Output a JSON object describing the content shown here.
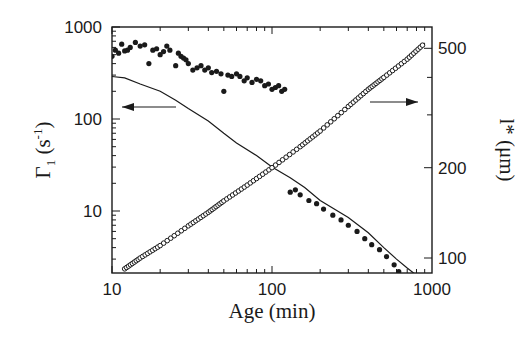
{
  "chart_data": {
    "type": "scatter",
    "title": "",
    "xlabel": "Age (min)",
    "ylabel_left": "Γ1 (s-1)",
    "ylabel_right": "l* (μm)",
    "xscale": "log",
    "yscale_left": "log",
    "yscale_right": "log",
    "xlim": [
      10,
      1000
    ],
    "ylim_left": [
      2,
      1000
    ],
    "ylim_right": [
      90,
      560
    ],
    "x_ticks": [
      10,
      100,
      1000
    ],
    "x_tick_labels": [
      "10",
      "100",
      "1000"
    ],
    "y_left_ticks": [
      10,
      100,
      1000
    ],
    "y_left_tick_labels": [
      "10",
      "100",
      "1000"
    ],
    "y_right_ticks": [
      100,
      200,
      500
    ],
    "y_right_tick_labels": [
      "100",
      "200",
      "500"
    ],
    "grid": false,
    "legend": null,
    "annotations": [
      {
        "text": "arrow pointing left (series belongs to left axis)",
        "x": 20,
        "y": 140
      },
      {
        "text": "arrow pointing right (series belongs to right axis)",
        "x": 500,
        "y": 200
      }
    ],
    "series": [
      {
        "name": "Gamma1 measured (filled dots), early",
        "axis": "left",
        "marker": "filled-circle",
        "x": [
          10,
          10.5,
          11,
          11.5,
          12,
          12.5,
          13,
          14,
          15,
          16,
          17,
          18,
          19,
          20,
          21,
          22,
          23,
          25,
          26,
          27,
          28,
          29,
          30,
          32,
          34,
          36,
          38,
          40,
          42,
          45,
          48,
          50,
          53,
          56,
          60,
          63,
          67,
          70,
          75,
          80,
          85,
          90,
          95,
          100,
          105,
          110,
          115,
          120
        ],
        "y": [
          480,
          560,
          520,
          650,
          550,
          560,
          600,
          680,
          620,
          640,
          400,
          560,
          580,
          500,
          540,
          620,
          560,
          380,
          520,
          480,
          460,
          440,
          400,
          340,
          360,
          380,
          340,
          360,
          320,
          330,
          310,
          200,
          300,
          290,
          310,
          290,
          260,
          280,
          250,
          270,
          260,
          230,
          240,
          210,
          220,
          230,
          200,
          210
        ]
      },
      {
        "name": "Gamma1 measured (filled dots), late",
        "axis": "left",
        "marker": "filled-circle",
        "x": [
          130,
          140,
          150,
          170,
          190,
          210,
          240,
          270,
          300,
          340,
          380,
          420,
          470,
          520,
          580,
          620
        ],
        "y": [
          16,
          17,
          15,
          13,
          12,
          10.5,
          9,
          8,
          7,
          6,
          5,
          4.3,
          3.8,
          3.2,
          2.6,
          2.2
        ]
      },
      {
        "name": "Gamma1 fit (solid line)",
        "axis": "left",
        "marker": "line",
        "x": [
          10,
          12,
          15,
          20,
          25,
          30,
          40,
          50,
          60,
          80,
          100,
          130,
          160,
          200,
          300,
          400,
          500,
          600,
          700,
          800
        ],
        "y": [
          290,
          280,
          240,
          200,
          160,
          130,
          95,
          70,
          55,
          40,
          30,
          23,
          18,
          13,
          8.5,
          5.8,
          4.0,
          3.0,
          2.4,
          2.0
        ]
      },
      {
        "name": "l* measured (open circles) with fit line",
        "axis": "right",
        "marker": "open-circle",
        "x": [
          12,
          15,
          20,
          30,
          40,
          50,
          70,
          100,
          150,
          200,
          300,
          400,
          500,
          700,
          900
        ],
        "y": [
          92,
          100,
          110,
          128,
          142,
          155,
          175,
          200,
          235,
          265,
          320,
          365,
          400,
          460,
          520
        ]
      }
    ]
  },
  "axes": {
    "x_label": "Age (min)",
    "y_left_label_main": "Γ",
    "y_left_label_sub": "1",
    "y_left_label_unit_open": "(s",
    "y_left_label_unit_sup": "-1",
    "y_left_label_unit_close": ")",
    "y_right_label": "l* (μm)",
    "x_tick_labels": [
      "10",
      "100",
      "1000"
    ],
    "y_left_tick_labels": [
      "10",
      "100",
      "1000"
    ],
    "y_right_tick_labels": [
      "100",
      "200",
      "500"
    ]
  }
}
